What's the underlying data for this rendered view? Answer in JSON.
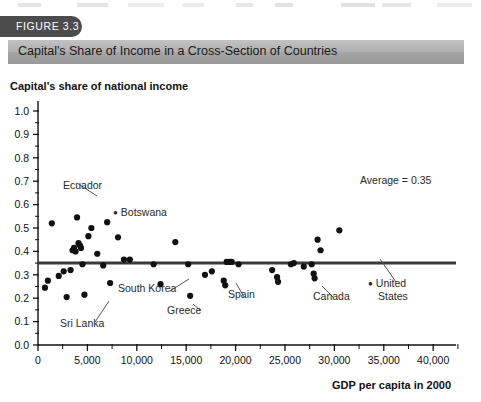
{
  "figure": {
    "number_label": "FIGURE 3.3",
    "title": "Capital's Share of Income in a Cross-Section of Countries",
    "tab_color": "#4c4c4c",
    "titlebar_color": "#adadad"
  },
  "chart_data": {
    "type": "scatter",
    "title": "Capital's Share of Income in a Cross-Section of Countries",
    "xlabel": "GDP per capita in 2000",
    "ylabel": "Capital's share of national income",
    "xlim": [
      0,
      41500
    ],
    "ylim": [
      0.0,
      1.0
    ],
    "grid": false,
    "legend": null,
    "xticks": [
      0,
      5000,
      10000,
      15000,
      20000,
      25000,
      30000,
      35000,
      40000
    ],
    "xtick_labels": [
      "0",
      "5,000",
      "10,000",
      "15,000",
      "20,000",
      "25,000",
      "30,000",
      "35,000",
      "40,000"
    ],
    "xminor_step": 2500,
    "yticks": [
      0.0,
      0.1,
      0.2,
      0.3,
      0.4,
      0.5,
      0.6,
      0.7,
      0.8,
      0.9,
      1.0
    ],
    "ytick_labels": [
      "0.0",
      "0.1",
      "0.2",
      "0.3",
      "0.4",
      "0.5",
      "0.6",
      "0.7",
      "0.8",
      "0.9",
      "1.0"
    ],
    "reference_line": {
      "value": 0.35,
      "label": "Average = 0.35",
      "orientation": "horizontal",
      "color": "#3a3a3a"
    },
    "marker_color": "#111111",
    "points": [
      {
        "x": 700,
        "y": 0.245
      },
      {
        "x": 1000,
        "y": 0.275
      },
      {
        "x": 1400,
        "y": 0.52
      },
      {
        "x": 2100,
        "y": 0.295
      },
      {
        "x": 2600,
        "y": 0.315
      },
      {
        "x": 2900,
        "y": 0.205
      },
      {
        "x": 3300,
        "y": 0.32
      },
      {
        "x": 3500,
        "y": 0.405
      },
      {
        "x": 3650,
        "y": 0.415
      },
      {
        "x": 3800,
        "y": 0.4
      },
      {
        "x": 3950,
        "y": 0.545,
        "label": "Ecuador"
      },
      {
        "x": 4100,
        "y": 0.435
      },
      {
        "x": 4250,
        "y": 0.425
      },
      {
        "x": 4350,
        "y": 0.415
      },
      {
        "x": 4500,
        "y": 0.345
      },
      {
        "x": 4700,
        "y": 0.215
      },
      {
        "x": 5100,
        "y": 0.465
      },
      {
        "x": 5400,
        "y": 0.5
      },
      {
        "x": 6000,
        "y": 0.39
      },
      {
        "x": 6600,
        "y": 0.34
      },
      {
        "x": 7000,
        "y": 0.525,
        "label": "Botswana"
      },
      {
        "x": 7300,
        "y": 0.265
      },
      {
        "x": 8100,
        "y": 0.46
      },
      {
        "x": 8700,
        "y": 0.365
      },
      {
        "x": 9300,
        "y": 0.365
      },
      {
        "x": 11700,
        "y": 0.345
      },
      {
        "x": 12400,
        "y": 0.26
      },
      {
        "x": 13900,
        "y": 0.44
      },
      {
        "x": 15200,
        "y": 0.345,
        "label": "South Korea"
      },
      {
        "x": 15400,
        "y": 0.21,
        "label": "Greece"
      },
      {
        "x": 16900,
        "y": 0.3
      },
      {
        "x": 17600,
        "y": 0.315
      },
      {
        "x": 18800,
        "y": 0.275
      },
      {
        "x": 18950,
        "y": 0.255
      },
      {
        "x": 19100,
        "y": 0.355
      },
      {
        "x": 19400,
        "y": 0.355,
        "label": "Spain"
      },
      {
        "x": 19600,
        "y": 0.355
      },
      {
        "x": 20300,
        "y": 0.345
      },
      {
        "x": 23700,
        "y": 0.32
      },
      {
        "x": 24200,
        "y": 0.29
      },
      {
        "x": 24300,
        "y": 0.27
      },
      {
        "x": 25600,
        "y": 0.345
      },
      {
        "x": 25900,
        "y": 0.35
      },
      {
        "x": 26900,
        "y": 0.335
      },
      {
        "x": 27700,
        "y": 0.345
      },
      {
        "x": 27900,
        "y": 0.305
      },
      {
        "x": 28000,
        "y": 0.285,
        "label": "Canada"
      },
      {
        "x": 28300,
        "y": 0.45
      },
      {
        "x": 28600,
        "y": 0.405
      },
      {
        "x": 30500,
        "y": 0.49
      }
    ],
    "annotations": [
      {
        "text": "Ecuador",
        "style": "leader"
      },
      {
        "text": "Botswana",
        "style": "bulleted"
      },
      {
        "text": "Sri Lanka",
        "style": "leader"
      },
      {
        "text": "South Korea",
        "style": "leader"
      },
      {
        "text": "Greece",
        "style": "leader"
      },
      {
        "text": "Spain",
        "style": "leader"
      },
      {
        "text": "Canada",
        "style": "leader"
      },
      {
        "text": "United",
        "style": "bulleted"
      },
      {
        "text": "States",
        "style": "plain"
      },
      {
        "text": "Average = 0.35",
        "style": "leader"
      }
    ]
  }
}
